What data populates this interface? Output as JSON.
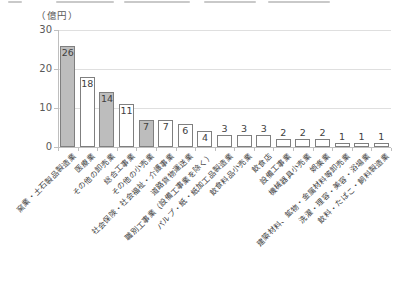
{
  "figure": {
    "unit_label": "（億円）"
  },
  "chart_data": {
    "type": "bar",
    "title": "",
    "ylabel": "（億円）",
    "ylim": [
      0,
      30
    ],
    "yticks": [
      0,
      10,
      20,
      30
    ],
    "grid": true,
    "legend": false,
    "categories": [
      "窯業・土石製品製造業",
      "医療業",
      "その他の卸売業",
      "総合工事業",
      "その他の小売業",
      "社会保険・社会福祉・介護事業",
      "道路貨物運送業",
      "職別工事業（設備工事業を除く）",
      "パルプ・紙・紙加工品製造業",
      "飲食料品小売業",
      "飲食店",
      "設備工事業",
      "機械器具小売業",
      "娯楽業",
      "建築材料、鉱物・金属材料等卸売業",
      "洗濯・理容・美容・浴場業",
      "飲料・たばこ・飼料製造業"
    ],
    "values": [
      26,
      18,
      14,
      11,
      7,
      7,
      6,
      4,
      3,
      3,
      3,
      2,
      2,
      2,
      1,
      1,
      1
    ],
    "bar_shading": [
      "gray",
      "white",
      "gray",
      "white",
      "gray",
      "white",
      "white",
      "white",
      "white",
      "white",
      "white",
      "white",
      "white",
      "white",
      "white",
      "white",
      "white"
    ],
    "value_label_position": [
      "inside",
      "inside",
      "inside",
      "inside",
      "inside",
      "inside",
      "inside",
      "inside",
      "above",
      "above",
      "above",
      "above",
      "above",
      "above",
      "above",
      "above",
      "above"
    ],
    "colors": {
      "gray_fill": "#bdbdbd",
      "white_fill": "#ffffff",
      "bar_border": "#7f7f7f",
      "gridline": "#dfdfdf",
      "axis": "#bfbfbf",
      "tick_text": "#595959",
      "value_text": "#404040"
    }
  }
}
